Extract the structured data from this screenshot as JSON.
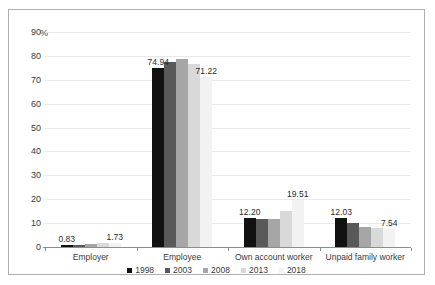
{
  "chart_data": {
    "type": "bar",
    "title": "",
    "subtitle": "",
    "xlabel": "",
    "ylabel": "%",
    "ylim": [
      0,
      90
    ],
    "ytick_step": 10,
    "yticks": [
      "90",
      "80",
      "70",
      "60",
      "50",
      "40",
      "30",
      "20",
      "10",
      "0"
    ],
    "grid": true,
    "grid_axis": "y",
    "legend_position": "bottom",
    "categories": [
      "Employer",
      "Employee",
      "Own account worker",
      "Unpaid family worker"
    ],
    "series": [
      {
        "name": "1998",
        "color": "#111111",
        "values": [
          0.83,
          74.94,
          12.2,
          12.03
        ]
      },
      {
        "name": "2003",
        "color": "#595959",
        "values": [
          1.05,
          77.35,
          11.75,
          9.85
        ]
      },
      {
        "name": "2008",
        "color": "#a6a6a6",
        "values": [
          1.25,
          78.6,
          11.7,
          8.45
        ]
      },
      {
        "name": "2013",
        "color": "#d9d9d9",
        "values": [
          1.5,
          76.5,
          15.2,
          7.9
        ]
      },
      {
        "name": "2018",
        "color": "#f2f2f2",
        "values": [
          1.73,
          71.22,
          19.51,
          7.54
        ]
      }
    ],
    "annotations": [
      {
        "text": "0.83",
        "category": "Employer",
        "series": "1998"
      },
      {
        "text": "1.73",
        "category": "Employer",
        "series": "2018"
      },
      {
        "text": "74.94",
        "category": "Employee",
        "series": "1998"
      },
      {
        "text": "71.22",
        "category": "Employee",
        "series": "2018"
      },
      {
        "text": "12.20",
        "category": "Own account worker",
        "series": "1998"
      },
      {
        "text": "19.51",
        "category": "Own account worker",
        "series": "2018"
      },
      {
        "text": "12.03",
        "category": "Unpaid family worker",
        "series": "1998"
      },
      {
        "text": "7.54",
        "category": "Unpaid family worker",
        "series": "2018"
      }
    ]
  },
  "axis": {
    "y_unit": "%",
    "ticks": [
      "90",
      "80",
      "70",
      "60",
      "50",
      "40",
      "30",
      "20",
      "10",
      "0"
    ]
  },
  "legend": {
    "items": [
      {
        "label": "1998"
      },
      {
        "label": "2003"
      },
      {
        "label": "2008"
      },
      {
        "label": "2013"
      },
      {
        "label": "2018"
      }
    ]
  }
}
